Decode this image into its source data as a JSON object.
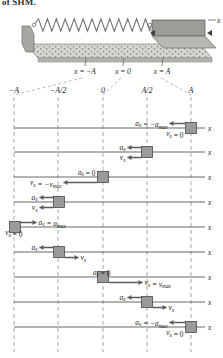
{
  "figure": {
    "cut_heading": "of SHM.",
    "apparatus": {
      "name": "spring-mass-air-track",
      "spring_label": "spring",
      "block_label": "glider",
      "axis_label": "x",
      "position_marks": [
        "x = −A",
        "x = 0",
        "x = A"
      ]
    },
    "axis_label": "x",
    "column_headers": [
      "−A",
      "−A/2",
      "0",
      "A/2",
      "A"
    ],
    "column_positions": [
      -1,
      -0.5,
      0,
      0.5,
      1
    ],
    "colors": {
      "block_fill": "#9a9a9a",
      "block_stroke": "#4a4a4a",
      "axis": "#4c4c4c",
      "grid": "#8c8c8c",
      "track_fill": "#c9c9c4",
      "track_top": "#d7d7d2",
      "spring": "#6e6e6e",
      "text": "#1a1a1a"
    },
    "rows": [
      {
        "index": 1,
        "block_position": 1,
        "a_text": "aₓ = −aₘₐₓ",
        "a_math": {
          "sub": "x",
          "value": "−a",
          "valsub": "max"
        },
        "a_arrow": "left",
        "a_arrow_len": 16,
        "v_text": "vₓ = 0",
        "v_arrow": "none",
        "v_arrow_len": 0,
        "a_side": "left",
        "v_side": "left"
      },
      {
        "index": 2,
        "block_position": 0.5,
        "a_text": "aₓ",
        "a_arrow": "left",
        "a_arrow_len": 14,
        "v_text": "vₓ",
        "v_arrow": "left",
        "v_arrow_len": 14,
        "a_side": "left",
        "v_side": "left"
      },
      {
        "index": 3,
        "block_position": 0,
        "a_text": "aₓ = 0",
        "a_arrow": "none",
        "a_arrow_len": 0,
        "v_text": "vₓ = −vₘₐₓ",
        "v_arrow": "left",
        "v_arrow_len": 34,
        "a_side": "left",
        "v_side": "left"
      },
      {
        "index": 4,
        "block_position": -0.5,
        "a_text": "aₓ",
        "a_arrow": "left",
        "a_arrow_len": 14,
        "v_text": "vₓ",
        "v_arrow": "left",
        "v_arrow_len": 14,
        "a_side": "right",
        "v_side": "left"
      },
      {
        "index": 5,
        "block_position": -1,
        "a_text": "aₓ = aₘₐₓ",
        "a_arrow": "right",
        "a_arrow_len": 16,
        "v_text": "vₓ = 0",
        "v_arrow": "none",
        "v_arrow_len": 0,
        "a_side": "right",
        "v_side": "right"
      },
      {
        "index": 6,
        "block_position": -0.5,
        "a_text": "aₓ",
        "a_arrow": "left",
        "a_arrow_len": 14,
        "v_text": "vₓ",
        "v_arrow": "right",
        "v_arrow_len": 14,
        "a_side": "right",
        "v_side": "right"
      },
      {
        "index": 7,
        "block_position": 0,
        "a_text": "aₓ = 0",
        "a_arrow": "none",
        "a_arrow_len": 0,
        "v_text": "vₓ = vₘₐₓ",
        "v_arrow": "right",
        "v_arrow_len": 34,
        "a_side": "right",
        "v_side": "right"
      },
      {
        "index": 8,
        "block_position": 0.5,
        "a_text": "aₓ",
        "a_arrow": "left",
        "a_arrow_len": 14,
        "v_text": "vₓ",
        "v_arrow": "right",
        "v_arrow_len": 14,
        "a_side": "left",
        "v_side": "right"
      },
      {
        "index": 9,
        "block_position": 1,
        "a_text": "aₓ = −aₘₐₓ",
        "a_arrow": "left",
        "a_arrow_len": 16,
        "v_text": "vₓ = 0",
        "v_arrow": "none",
        "v_arrow_len": 0,
        "a_side": "left",
        "v_side": "left"
      }
    ]
  }
}
